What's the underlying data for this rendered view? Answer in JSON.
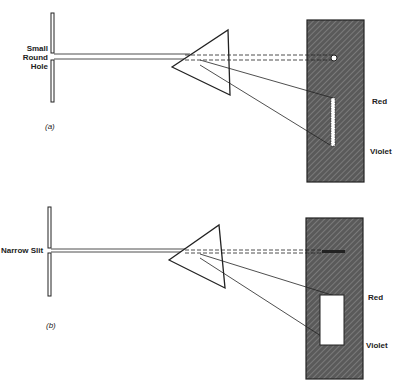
{
  "panel_a": {
    "aperture_label_lines": [
      "Small",
      "Round",
      "Hole"
    ],
    "caption": "(a)",
    "screen_label_top": "Red",
    "screen_label_bottom": "Violet"
  },
  "panel_b": {
    "aperture_label": "Narrow Slit",
    "caption": "(b)",
    "screen_label_top": "Red",
    "screen_label_bottom": "Violet"
  },
  "colors": {
    "ink": "#222222",
    "screen_fill": "#6e6e6e"
  }
}
